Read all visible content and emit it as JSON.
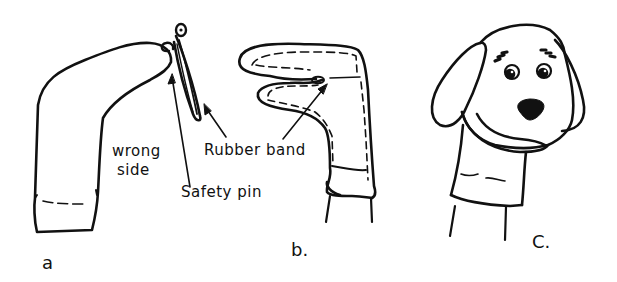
{
  "diagram": {
    "colors": {
      "ink": "#111111",
      "background": "#ffffff"
    },
    "figures": [
      {
        "id": "a",
        "caption": "a",
        "description": "Sock turned wrong side out, toe bent over, pinned with safety pin and rubber band",
        "labels": {
          "wrong_side": [
            "wrong",
            "side"
          ],
          "safety_pin": "Safety pin",
          "rubber_band": "Rubber band"
        }
      },
      {
        "id": "b",
        "caption": "b.",
        "description": "Hand inside sock forming mouth, rubber band at fold",
        "labels": {}
      },
      {
        "id": "c",
        "caption": "C.",
        "description": "Finished dog sock puppet with floppy ears, eyes with lashes, and black nose",
        "labels": {}
      }
    ]
  }
}
